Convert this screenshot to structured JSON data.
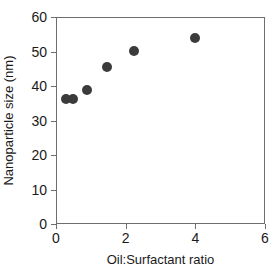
{
  "chart_data": {
    "type": "scatter",
    "title": "",
    "xlabel": "Oil:Surfactant ratio",
    "ylabel": "Nanoparticle size (nm)",
    "xlim": [
      0,
      6
    ],
    "ylim": [
      0,
      60
    ],
    "xticks": [
      "0",
      "2",
      "4",
      "6"
    ],
    "xtick_values": [
      0,
      2,
      4,
      6
    ],
    "yticks": [
      "0",
      "10",
      "20",
      "30",
      "40",
      "50",
      "60"
    ],
    "ytick_values": [
      0,
      10,
      20,
      30,
      40,
      50,
      60
    ],
    "grid": false,
    "legend": false,
    "marker_color": "#3b3b3b",
    "marker_shape": "circle",
    "axis_color": "#6e6e6e",
    "series": [
      {
        "name": "Nanoparticle size",
        "points": [
          {
            "x": 0.3,
            "y": 36.3
          },
          {
            "x": 0.5,
            "y": 36.3
          },
          {
            "x": 0.9,
            "y": 38.7
          },
          {
            "x": 1.45,
            "y": 45.5
          },
          {
            "x": 2.25,
            "y": 50.2
          },
          {
            "x": 4.0,
            "y": 53.8
          }
        ]
      }
    ]
  }
}
